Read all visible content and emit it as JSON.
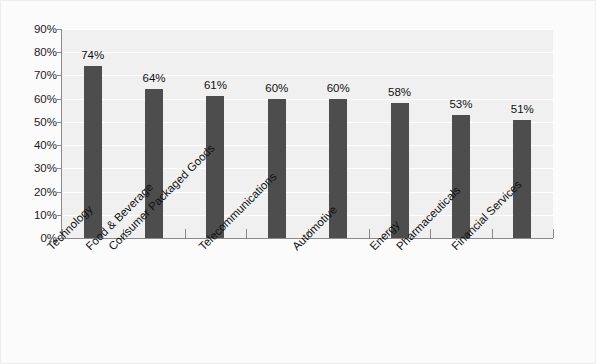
{
  "chart_data": {
    "type": "bar",
    "title": "",
    "subtitle": "",
    "xlabel": "",
    "ylabel": "",
    "ylim": [
      0,
      90
    ],
    "ytick_step": 10,
    "ytick_labels": [
      "0%",
      "10%",
      "20%",
      "30%",
      "40%",
      "50%",
      "60%",
      "70%",
      "80%",
      "90%"
    ],
    "ytick_values": [
      0,
      10,
      20,
      30,
      40,
      50,
      60,
      70,
      80,
      90
    ],
    "grid": true,
    "grid_axis": "y",
    "legend": false,
    "legend_position": "none",
    "categories": [
      "Technology",
      "Food & Beverage",
      "Consumer Packaged Goods",
      "Telecommunications",
      "Automotive",
      "Energy",
      "Pharmaceuticals",
      "Financial Services"
    ],
    "values": [
      74,
      64,
      61,
      60,
      60,
      58,
      53,
      51
    ],
    "data_labels": [
      "74%",
      "64%",
      "61%",
      "60%",
      "60%",
      "58%",
      "53%",
      "51%"
    ],
    "colors": {
      "bar": "#4d4d4d",
      "plot_background": "#f0f0f0",
      "figure_background": "#fbfbfb",
      "gridline": "#ffffff",
      "axis": "#8a8a8a",
      "text": "#111111",
      "border": "#ededed"
    },
    "xtick_label_rotation": -45
  }
}
